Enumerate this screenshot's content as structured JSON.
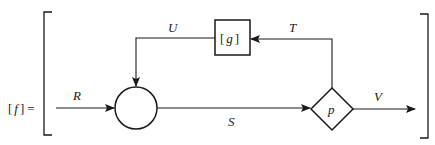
{
  "equation": {
    "lhs_open": "[",
    "lhs_symbol": "f",
    "lhs_close": "]",
    "equals": "="
  },
  "nodes": {
    "junction": {
      "label": ""
    },
    "block": {
      "label_open": "[",
      "label_symbol": "g",
      "label_close": "]"
    },
    "decision": {
      "label": "p"
    }
  },
  "edges": {
    "input": {
      "label": "R"
    },
    "forward": {
      "label": "S"
    },
    "output": {
      "label": "V"
    },
    "feedback_to_block": {
      "label": "T"
    },
    "feedback_from_block": {
      "label": "U"
    }
  },
  "colors": {
    "ink": "#1a1a1a",
    "background": "#ffffff"
  }
}
